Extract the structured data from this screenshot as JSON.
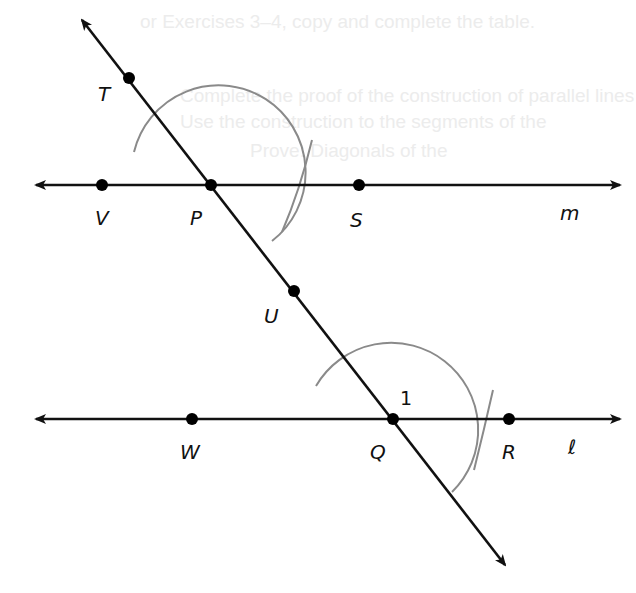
{
  "diagram": {
    "background_bleed_text": [
      "or Exercises 3–4, copy and complete the table.",
      "Complete the proof of the construction of parallel lines",
      "Use the construction to the segments of the",
      "Prove: Diagonals of the"
    ],
    "lines": {
      "transversal": {
        "from": [
          80,
          18
        ],
        "to": [
          506,
          566
        ],
        "arrows": "both"
      },
      "m": {
        "label": "m",
        "y": 185,
        "x_start": 33,
        "x_end": 622,
        "arrows": "both"
      },
      "l": {
        "label": "ℓ",
        "y": 419,
        "x_start": 33,
        "x_end": 622,
        "arrows": "both"
      }
    },
    "points": [
      {
        "name": "T",
        "x": 129,
        "y": 77
      },
      {
        "name": "V",
        "x": 102,
        "y": 185
      },
      {
        "name": "P",
        "x": 211,
        "y": 185
      },
      {
        "name": "S",
        "x": 359,
        "y": 185
      },
      {
        "name": "U",
        "x": 294,
        "y": 311
      },
      {
        "name": "W",
        "x": 192,
        "y": 419
      },
      {
        "name": "Q",
        "x": 393,
        "y": 419
      },
      {
        "name": "R",
        "x": 509,
        "y": 419
      }
    ],
    "labels": {
      "T": "T",
      "V": "V",
      "P": "P",
      "S": "S",
      "U": "U",
      "W": "W",
      "Q": "Q",
      "R": "R",
      "m": "m",
      "l": "ℓ",
      "angle_1": "1"
    },
    "arcs": [
      {
        "center": "P",
        "radius": 87,
        "description": "compass arc centered at P"
      },
      {
        "center": "Q",
        "radius": 87,
        "description": "compass arc centered at Q"
      }
    ],
    "angle_marker": {
      "label": "1",
      "at": "Q"
    },
    "colors": {
      "lines": "#111111",
      "arcs": "#8a8a8a",
      "points": "#000000",
      "background": "#ffffff"
    }
  }
}
